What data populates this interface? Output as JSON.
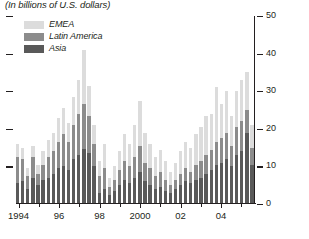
{
  "figure": {
    "subtitle": "(In billions of U.S. dollars)"
  },
  "legend": {
    "items": [
      {
        "label": "EMEA",
        "color": "#dcdcdc"
      },
      {
        "label": "Latin America",
        "color": "#8c8c8c"
      },
      {
        "label": "Asia",
        "color": "#595959"
      }
    ]
  },
  "axes": {
    "y_ticks": [
      "0",
      "10",
      "20",
      "30",
      "40",
      "50"
    ],
    "y_tick_values": [
      0,
      10,
      20,
      30,
      40,
      50
    ],
    "x_ticks": [
      "1994",
      "96",
      "98",
      "2000",
      "02",
      "04"
    ],
    "x_tick_index": [
      0,
      8,
      16,
      24,
      32,
      40
    ]
  },
  "chart_data": {
    "type": "bar",
    "title": "",
    "subtitle": "(In billions of U.S. dollars)",
    "xlabel": "",
    "ylabel": "",
    "ylim": [
      0,
      50
    ],
    "grid": false,
    "stacked": true,
    "legend_position": "top-left",
    "categories": [
      "1994Q1",
      "1994Q2",
      "1994Q3",
      "1994Q4",
      "1995Q1",
      "1995Q2",
      "1995Q3",
      "1995Q4",
      "1996Q1",
      "1996Q2",
      "1996Q3",
      "1996Q4",
      "1997Q1",
      "1997Q2",
      "1997Q3",
      "1997Q4",
      "1998Q1",
      "1998Q2",
      "1998Q3",
      "1998Q4",
      "1999Q1",
      "1999Q2",
      "1999Q3",
      "1999Q4",
      "2000Q1",
      "2000Q2",
      "2000Q3",
      "2000Q4",
      "2001Q1",
      "2001Q2",
      "2001Q3",
      "2001Q4",
      "2002Q1",
      "2002Q2",
      "2002Q3",
      "2002Q4",
      "2003Q1",
      "2003Q2",
      "2003Q3",
      "2003Q4",
      "2004Q1",
      "2004Q2",
      "2004Q3",
      "2004Q4",
      "2005Q1",
      "2005Q2",
      "2005Q3"
    ],
    "series": [
      {
        "name": "Asia",
        "color": "#595959",
        "values": [
          5.5,
          6.0,
          4.0,
          7.0,
          5.0,
          6.5,
          7.0,
          8.0,
          9.5,
          10.0,
          9.0,
          12.0,
          13.0,
          14.5,
          13.5,
          10.0,
          3.0,
          4.0,
          2.5,
          3.5,
          5.0,
          6.5,
          5.5,
          7.0,
          8.5,
          6.0,
          5.0,
          4.0,
          4.5,
          3.5,
          3.0,
          4.0,
          5.0,
          6.0,
          5.5,
          6.5,
          7.0,
          8.0,
          9.0,
          10.5,
          11.0,
          12.0,
          10.0,
          13.0,
          14.0,
          19.0,
          10.5
        ]
      },
      {
        "name": "Latin America",
        "color": "#8c8c8c",
        "values": [
          7.0,
          6.0,
          3.5,
          5.5,
          3.0,
          4.0,
          5.5,
          6.0,
          7.0,
          8.5,
          7.5,
          9.0,
          11.0,
          12.0,
          10.0,
          6.0,
          4.5,
          5.5,
          2.0,
          3.0,
          4.0,
          5.0,
          4.5,
          5.5,
          7.0,
          5.0,
          4.5,
          3.5,
          4.0,
          3.0,
          2.0,
          2.5,
          3.0,
          3.5,
          3.0,
          4.0,
          4.5,
          5.0,
          5.5,
          6.0,
          6.5,
          7.0,
          5.5,
          7.5,
          8.0,
          6.0,
          4.5
        ]
      },
      {
        "name": "EMEA",
        "color": "#dcdcdc",
        "values": [
          3.5,
          3.0,
          2.0,
          3.0,
          2.5,
          3.5,
          4.5,
          5.0,
          6.5,
          7.0,
          5.0,
          7.5,
          9.0,
          14.5,
          8.0,
          5.0,
          4.0,
          6.5,
          2.5,
          3.5,
          5.0,
          7.0,
          6.0,
          8.5,
          12.0,
          8.0,
          6.5,
          5.0,
          6.0,
          5.0,
          3.5,
          4.5,
          6.0,
          7.0,
          6.5,
          8.0,
          9.0,
          10.5,
          9.5,
          14.5,
          9.0,
          11.0,
          8.0,
          9.5,
          11.0,
          10.0,
          6.0
        ]
      }
    ]
  }
}
